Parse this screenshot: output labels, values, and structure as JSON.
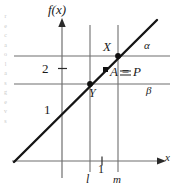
{
  "figure": {
    "type": "math-graph",
    "axes": {
      "y_axis_label": "f(x)",
      "x_axis_label": "x",
      "y_ticks": [
        {
          "label": "1",
          "value": 1
        },
        {
          "label": "2",
          "value": 2
        }
      ],
      "x_ticks": [
        {
          "label": "1",
          "value": 1
        }
      ]
    },
    "horizontal_lines": [
      {
        "name": "alpha",
        "label": "α",
        "y_value": 3
      },
      {
        "name": "beta",
        "label": "β",
        "y_value": 2
      }
    ],
    "vertical_lines": [
      {
        "name": "l",
        "label": "l",
        "x_value": 0.6
      },
      {
        "name": "m",
        "label": "m",
        "x_value": 1.4
      }
    ],
    "points": [
      {
        "name": "X",
        "label": "X",
        "x": 1.4,
        "y": 3.0
      },
      {
        "name": "Y",
        "label": "Y",
        "x": 0.6,
        "y": 2.0
      },
      {
        "name": "A",
        "label": "A = P",
        "x": 1.0,
        "y": 2.5
      }
    ],
    "curve": {
      "name": "f(x)",
      "kind": "line",
      "slope": 1.25,
      "intercept": 1.25
    },
    "colors": {
      "ink": "#1a1a1a",
      "grid": "#6f6f6f",
      "curve": "#151515",
      "faint": "#c9c9c9"
    }
  },
  "gutter_bleed": {
    "text": "r\ne\nc\na\no\nl\na\ns\ng\ne\nv\ns"
  },
  "chart_data": {
    "type": "line",
    "title": "",
    "xlabel": "x",
    "ylabel": "f(x)",
    "xlim": [
      -1,
      2.4
    ],
    "ylim": [
      0,
      4.1
    ],
    "grid": false,
    "legend": "none",
    "series": [
      {
        "name": "f(x)",
        "x": [
          -1.0,
          2.3
        ],
        "y": [
          0.0,
          4.1
        ]
      }
    ],
    "reference_lines": [
      {
        "orientation": "horizontal",
        "label": "α",
        "value": 3.0
      },
      {
        "orientation": "horizontal",
        "label": "β",
        "value": 2.0
      },
      {
        "orientation": "vertical",
        "label": "l",
        "value": 0.6
      },
      {
        "orientation": "vertical",
        "label": "m",
        "value": 1.4
      }
    ],
    "annotations": [
      {
        "text": "X",
        "x": 1.4,
        "y": 3.0
      },
      {
        "text": "Y",
        "x": 0.6,
        "y": 2.0
      },
      {
        "text": "A = P",
        "x": 1.0,
        "y": 2.5
      }
    ],
    "xticks": [
      1
    ],
    "xticklabels": [
      "1"
    ],
    "yticks": [
      1,
      2
    ],
    "yticklabels": [
      "1",
      "2"
    ]
  }
}
